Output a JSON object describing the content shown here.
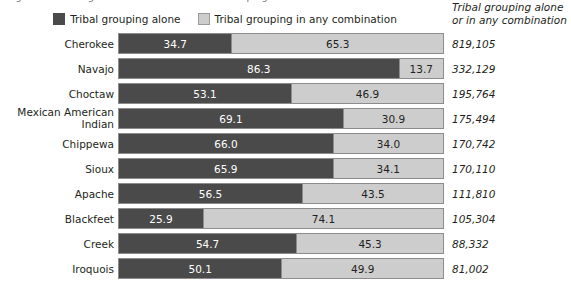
{
  "title_cut_off": "Figure 1. Ten Largest American Indian Tribal Groupings: 2010",
  "legend": {
    "items": [
      {
        "label": "Tribal grouping alone",
        "swatch": "dark-swatch-icon",
        "color": "#4a4a4a"
      },
      {
        "label": "Tribal grouping in any combination",
        "swatch": "light-swatch-icon",
        "color": "#cdcdcd"
      }
    ]
  },
  "right_header": {
    "line1": "Tribal grouping alone",
    "line2": "or in any combination"
  },
  "chart_data": {
    "type": "bar",
    "title": "Figure 1. Ten Largest American Indian Tribal Groupings: 2010",
    "xlabel": "",
    "ylabel": "",
    "xlim": [
      0,
      100
    ],
    "grid": false,
    "stacked": true,
    "orientation": "horizontal",
    "legend_position": "top-center",
    "categories": [
      "Cherokee",
      "Navajo",
      "Choctaw",
      "Mexican American Indian",
      "Chippewa",
      "Sioux",
      "Apache",
      "Blackfeet",
      "Creek",
      "Iroquois"
    ],
    "series": [
      {
        "name": "Tribal grouping alone",
        "color": "#4a4a4a",
        "values": [
          34.7,
          86.3,
          53.1,
          69.1,
          66.0,
          65.9,
          56.5,
          25.9,
          54.7,
          50.1
        ]
      },
      {
        "name": "Tribal grouping in any combination",
        "color": "#cdcdcd",
        "values": [
          65.3,
          13.7,
          46.9,
          30.9,
          34.0,
          34.1,
          43.5,
          74.1,
          45.3,
          49.9
        ]
      }
    ],
    "annotations": {
      "right_column_header": "Tribal grouping alone or in any combination",
      "right_column_values": [
        "819,105",
        "332,129",
        "195,764",
        "175,494",
        "170,742",
        "170,110",
        "111,810",
        "105,304",
        "88,332",
        "81,002"
      ]
    }
  },
  "rows": [
    {
      "label": "Cherokee",
      "label_line1": "Cherokee",
      "label_line2": "",
      "alone": "34.7",
      "combo": "65.3",
      "alone_pct": 34.7,
      "combo_pct": 65.3,
      "count": "819,105"
    },
    {
      "label": "Navajo",
      "label_line1": "Navajo",
      "label_line2": "",
      "alone": "86.3",
      "combo": "13.7",
      "alone_pct": 86.3,
      "combo_pct": 13.7,
      "count": "332,129"
    },
    {
      "label": "Choctaw",
      "label_line1": "Choctaw",
      "label_line2": "",
      "alone": "53.1",
      "combo": "46.9",
      "alone_pct": 53.1,
      "combo_pct": 46.9,
      "count": "195,764"
    },
    {
      "label": "Mexican American Indian",
      "label_line1": "Mexican American",
      "label_line2": "Indian",
      "alone": "69.1",
      "combo": "30.9",
      "alone_pct": 69.1,
      "combo_pct": 30.9,
      "count": "175,494"
    },
    {
      "label": "Chippewa",
      "label_line1": "Chippewa",
      "label_line2": "",
      "alone": "66.0",
      "combo": "34.0",
      "alone_pct": 66.0,
      "combo_pct": 34.0,
      "count": "170,742"
    },
    {
      "label": "Sioux",
      "label_line1": "Sioux",
      "label_line2": "",
      "alone": "65.9",
      "combo": "34.1",
      "alone_pct": 65.9,
      "combo_pct": 34.1,
      "count": "170,110"
    },
    {
      "label": "Apache",
      "label_line1": "Apache",
      "label_line2": "",
      "alone": "56.5",
      "combo": "43.5",
      "alone_pct": 56.5,
      "combo_pct": 43.5,
      "count": "111,810"
    },
    {
      "label": "Blackfeet",
      "label_line1": "Blackfeet",
      "label_line2": "",
      "alone": "25.9",
      "combo": "74.1",
      "alone_pct": 25.9,
      "combo_pct": 74.1,
      "count": "105,304"
    },
    {
      "label": "Creek",
      "label_line1": "Creek",
      "label_line2": "",
      "alone": "54.7",
      "combo": "45.3",
      "alone_pct": 54.7,
      "combo_pct": 45.3,
      "count": "88,332"
    },
    {
      "label": "Iroquois",
      "label_line1": "Iroquois",
      "label_line2": "",
      "alone": "50.1",
      "combo": "49.9",
      "alone_pct": 50.1,
      "combo_pct": 49.9,
      "count": "81,002"
    }
  ]
}
